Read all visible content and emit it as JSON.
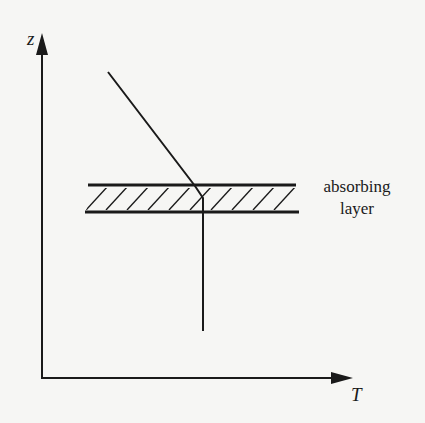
{
  "diagram": {
    "axes": {
      "y_label": "z",
      "x_label": "T"
    },
    "layer": {
      "label_line1": "absorbing",
      "label_line2": "layer",
      "pattern": "diagonal-hatch"
    },
    "profile": {
      "description": "Temperature decreases with height above the layer; constant temperature below the layer"
    },
    "colors": {
      "ink": "#1a1a1a",
      "background": "#f6f6f4"
    }
  }
}
